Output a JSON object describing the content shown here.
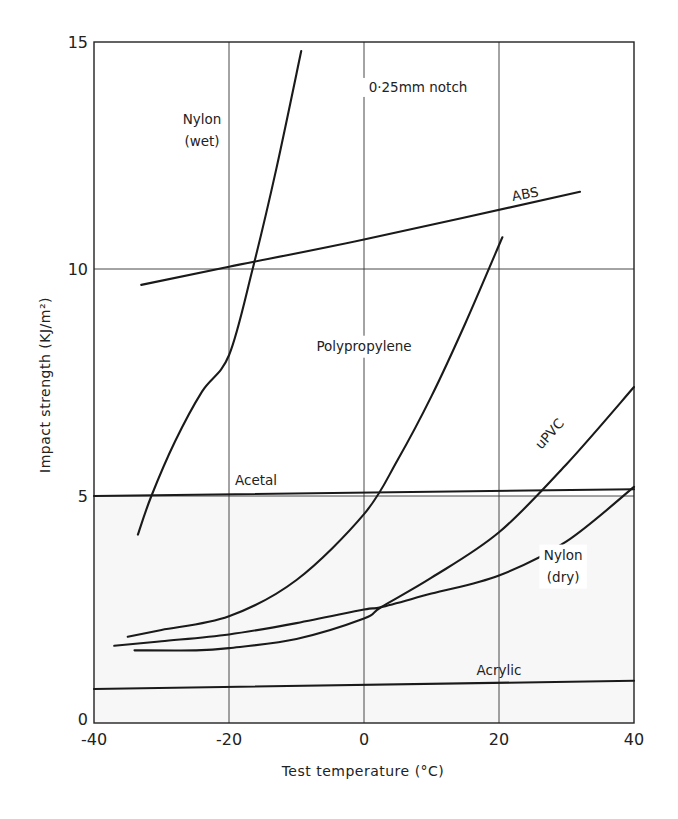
{
  "chart_data": {
    "type": "line",
    "title": "",
    "xlabel": "Test temperature (°C)",
    "ylabel": "Impact strength (KJ/m²)",
    "xlim": [
      -40,
      40
    ],
    "ylim": [
      0,
      15
    ],
    "x_ticks": [
      -40,
      -20,
      0,
      20,
      40
    ],
    "y_ticks": [
      0,
      5,
      10,
      15
    ],
    "grid": true,
    "annotations": [
      {
        "text": "0·25mm notch",
        "x": 8,
        "y": 13.9
      }
    ],
    "series": [
      {
        "name": "Nylon (wet)",
        "label_lines": [
          "Nylon",
          "(wet)"
        ],
        "label_pos": [
          -24,
          13.2
        ],
        "x": [
          -33.5,
          -31.5,
          -28,
          -24,
          -20,
          -16.5,
          -13,
          -9.3
        ],
        "y": [
          4.15,
          5.0,
          6.2,
          7.3,
          8.1,
          10.0,
          12.2,
          14.8
        ]
      },
      {
        "name": "ABS",
        "label_pos": [
          24,
          11.55
        ],
        "label_rotate": -10,
        "x": [
          -33,
          -20,
          0,
          32
        ],
        "y": [
          9.65,
          10.05,
          10.65,
          11.7
        ]
      },
      {
        "name": "Polypropylene",
        "label_pos": [
          0,
          8.2
        ],
        "x": [
          -35,
          -30,
          -20,
          -10,
          0,
          5,
          10,
          15,
          20.5
        ],
        "y": [
          1.9,
          2.05,
          2.35,
          3.15,
          4.6,
          5.8,
          7.2,
          8.8,
          10.7
        ]
      },
      {
        "name": "uPVC",
        "label_pos": [
          28,
          6.3
        ],
        "label_rotate": -48,
        "x": [
          -34,
          -25,
          -20,
          -10,
          0,
          2.5,
          10,
          20,
          30,
          40
        ],
        "y": [
          1.6,
          1.6,
          1.65,
          1.85,
          2.3,
          2.55,
          3.2,
          4.2,
          5.7,
          7.4
        ]
      },
      {
        "name": "Nylon (dry)",
        "label_lines": [
          "Nylon",
          "(dry)"
        ],
        "label_pos": [
          29.5,
          3.6
        ],
        "x": [
          -37,
          -30,
          -20,
          -10,
          0,
          2.5,
          10,
          20,
          30,
          40
        ],
        "y": [
          1.7,
          1.8,
          1.95,
          2.2,
          2.5,
          2.55,
          2.85,
          3.25,
          4.0,
          5.2
        ]
      },
      {
        "name": "Acetal",
        "label_pos": [
          -16,
          5.25
        ],
        "x": [
          -40,
          40
        ],
        "y": [
          5.0,
          5.15
        ]
      },
      {
        "name": "Acrylic",
        "label_pos": [
          20,
          1.05
        ],
        "x": [
          -40,
          40
        ],
        "y": [
          0.75,
          0.93
        ]
      }
    ],
    "colors": {
      "line": "#1a1a1a",
      "grid": "#333333",
      "background": "#ffffff",
      "lower_tint": "#f7f7f7"
    }
  }
}
